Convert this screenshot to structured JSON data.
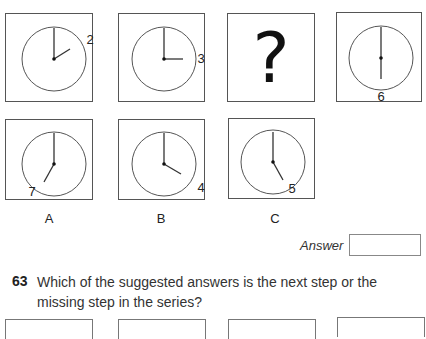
{
  "series": [
    {
      "id": "step-1",
      "type": "clock",
      "hour_label": "2",
      "hour_hand_angle": 60
    },
    {
      "id": "step-2",
      "type": "clock",
      "hour_label": "3",
      "hour_hand_angle": 90
    },
    {
      "id": "step-3",
      "type": "missing",
      "symbol": "?"
    },
    {
      "id": "step-4",
      "type": "clock",
      "hour_label": "6",
      "hour_hand_angle": 180
    }
  ],
  "options": [
    {
      "label": "A",
      "hour_label": "7",
      "hour_hand_angle": 210
    },
    {
      "label": "B",
      "hour_label": "4",
      "hour_hand_angle": 120
    },
    {
      "label": "C",
      "hour_label": "5",
      "hour_hand_angle": 150
    }
  ],
  "answer": {
    "label": "Answer",
    "value": ""
  },
  "next_question": {
    "number": "63",
    "text": "Which of the suggested answers is the next step or the missing step in the series?",
    "box_count": 4
  }
}
